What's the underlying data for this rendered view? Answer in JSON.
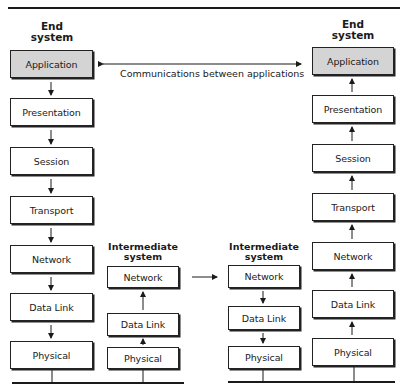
{
  "diagram": {
    "left_end_system": {
      "title_line1": "End",
      "title_line2": "system",
      "layers": [
        "Application",
        "Presentation",
        "Session",
        "Transport",
        "Network",
        "Data Link",
        "Physical"
      ]
    },
    "left_intermediate_system": {
      "title_line1": "Intermediate",
      "title_line2": "system",
      "layers": [
        "Network",
        "Data Link",
        "Physical"
      ]
    },
    "right_intermediate_system": {
      "title_line1": "Intermediate",
      "title_line2": "system",
      "layers": [
        "Network",
        "Data Link",
        "Physical"
      ]
    },
    "right_end_system": {
      "title_line1": "End",
      "title_line2": "system",
      "layers": [
        "Application",
        "Presentation",
        "Session",
        "Transport",
        "Network",
        "Data Link",
        "Physical"
      ]
    },
    "communication_label": "Communications between applications",
    "colors": {
      "application_fill": "#d4d4d4",
      "box_fill": "#ffffff",
      "line": "#1a1a1a"
    }
  }
}
